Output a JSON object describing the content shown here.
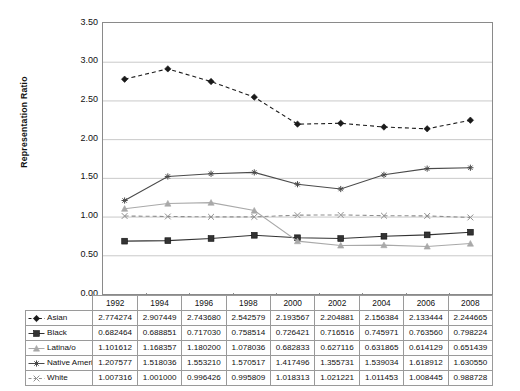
{
  "chart_data": {
    "type": "line",
    "title": "",
    "xlabel": "",
    "ylabel": "Representation Ratio",
    "ylim": [
      0.0,
      3.5
    ],
    "ytick_labels": [
      "3.50",
      "3.00",
      "2.50",
      "2.00",
      "1.50",
      "1.00",
      "0.50",
      "0.00"
    ],
    "ytick_values": [
      3.5,
      3.0,
      2.5,
      2.0,
      1.5,
      1.0,
      0.5,
      0.0
    ],
    "grid": true,
    "grid_axis": "y",
    "legend_position": "data-table-row-headers",
    "categories": [
      "1992",
      "1994",
      "1996",
      "1998",
      "2000",
      "2002",
      "2004",
      "2006",
      "2008"
    ],
    "series": [
      {
        "name": "Asian",
        "marker": "diamond",
        "line_style": "dashed",
        "color": "#1a1a1a",
        "values": [
          2.774274,
          2.907449,
          2.74368,
          2.542579,
          2.193567,
          2.204881,
          2.156384,
          2.133444,
          2.244665
        ],
        "labels": [
          "2.774274",
          "2.907449",
          "2.743680",
          "2.542579",
          "2.193567",
          "2.204881",
          "2.156384",
          "2.133444",
          "2.244665"
        ]
      },
      {
        "name": "Black",
        "marker": "square",
        "line_style": "solid",
        "color": "#333333",
        "values": [
          0.682464,
          0.688851,
          0.71703,
          0.758514,
          0.726421,
          0.716516,
          0.745971,
          0.76356,
          0.798224
        ],
        "labels": [
          "0.682464",
          "0.688851",
          "0.717030",
          "0.758514",
          "0.726421",
          "0.716516",
          "0.745971",
          "0.763560",
          "0.798224"
        ]
      },
      {
        "name": "Latina/o",
        "marker": "triangle",
        "line_style": "solid",
        "color": "#a9a9a9",
        "values": [
          1.101612,
          1.168357,
          1.1802,
          1.078036,
          0.682833,
          0.627116,
          0.631865,
          0.614129,
          0.651439
        ],
        "labels": [
          "1.101612",
          "1.168357",
          "1.180200",
          "1.078036",
          "0.682833",
          "0.627116",
          "0.631865",
          "0.614129",
          "0.651439"
        ]
      },
      {
        "name": "Native American",
        "marker": "asterisk",
        "line_style": "solid",
        "color": "#4a4a4a",
        "values": [
          1.207577,
          1.518036,
          1.55321,
          1.570517,
          1.417496,
          1.355731,
          1.539034,
          1.618912,
          1.63055
        ],
        "labels": [
          "1.207577",
          "1.518036",
          "1.553210",
          "1.570517",
          "1.417496",
          "1.355731",
          "1.539034",
          "1.618912",
          "1.630550"
        ]
      },
      {
        "name": "White",
        "marker": "x",
        "line_style": "dashed",
        "color": "#8f8f8f",
        "values": [
          1.007316,
          1.001,
          0.996426,
          0.995809,
          1.018313,
          1.021221,
          1.011453,
          1.008445,
          0.988728
        ],
        "labels": [
          "1.007316",
          "1.001000",
          "0.996426",
          "0.995809",
          "1.018313",
          "1.021221",
          "1.011453",
          "1.008445",
          "0.988728"
        ]
      }
    ]
  },
  "colors": {
    "axis": "#8a8a8a",
    "grid": "#c9c9c9",
    "table_border": "#9a9a9a",
    "text": "#111111"
  }
}
